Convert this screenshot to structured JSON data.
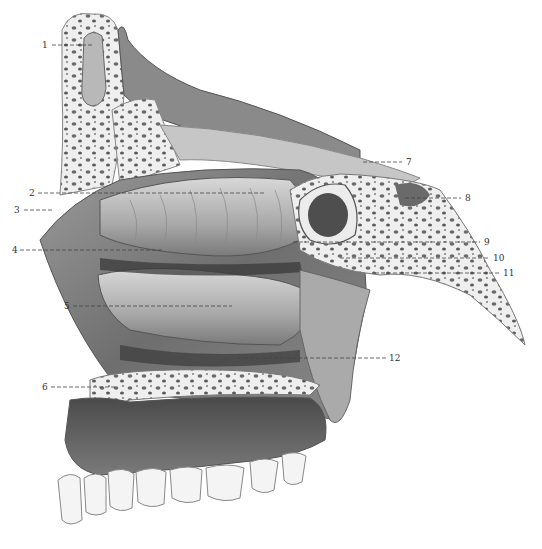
{
  "figure": {
    "background": "#ffffff",
    "ink": "#3a3a3a"
  },
  "labels": [
    {
      "num": "1",
      "x": 44,
      "y": 48,
      "x1": 52,
      "x2": 92,
      "ly": 45,
      "side": "left"
    },
    {
      "num": "2",
      "x": 30,
      "y": 195,
      "x1": 38,
      "x2": 265,
      "ly": 193,
      "side": "left"
    },
    {
      "num": "3",
      "x": 15,
      "y": 213,
      "x1": 24,
      "x2": 52,
      "ly": 210,
      "side": "left"
    },
    {
      "num": "4",
      "x": 12,
      "y": 253,
      "x1": 20,
      "x2": 162,
      "ly": 250,
      "side": "left"
    },
    {
      "num": "5",
      "x": 64,
      "y": 309,
      "x1": 73,
      "x2": 232,
      "ly": 306,
      "side": "left"
    },
    {
      "num": "6",
      "x": 42,
      "y": 390,
      "x1": 51,
      "x2": 116,
      "ly": 387,
      "side": "left"
    },
    {
      "num": "7",
      "x": 407,
      "y": 165,
      "x1": 363,
      "x2": 402,
      "ly": 162,
      "side": "right"
    },
    {
      "num": "8",
      "x": 466,
      "y": 201,
      "x1": 405,
      "x2": 461,
      "ly": 198,
      "side": "right"
    },
    {
      "num": "9",
      "x": 485,
      "y": 245,
      "x1": 293,
      "x2": 480,
      "ly": 242,
      "side": "right"
    },
    {
      "num": "10",
      "x": 494,
      "y": 261,
      "x1": 340,
      "x2": 490,
      "ly": 258,
      "side": "right"
    },
    {
      "num": "11",
      "x": 504,
      "y": 276,
      "x1": 375,
      "x2": 500,
      "ly": 273,
      "side": "right"
    },
    {
      "num": "12",
      "x": 390,
      "y": 361,
      "x1": 238,
      "x2": 386,
      "ly": 358,
      "side": "right"
    }
  ]
}
